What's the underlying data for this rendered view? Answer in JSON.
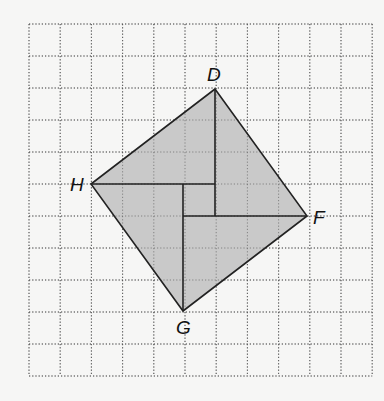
{
  "figure": {
    "type": "geometry-on-grid",
    "colors": {
      "background": "#f6f6f5",
      "grid": "#555555",
      "fill": "#c9c9c9",
      "stroke": "#222222",
      "label": "#111111"
    },
    "grid": {
      "x0": 29,
      "y0": 24,
      "cols": 11,
      "rows": 11,
      "cell_w": 31.2,
      "cell_h": 32
    },
    "vertices": {
      "D": {
        "label": "D",
        "x": 215,
        "y": 89
      },
      "F": {
        "label": "F",
        "x": 307,
        "y": 216
      },
      "G": {
        "label": "G",
        "x": 183,
        "y": 311
      },
      "H": {
        "label": "H",
        "x": 91,
        "y": 184
      }
    },
    "interior_segments": [
      {
        "from": [
          215,
          89
        ],
        "to": [
          215,
          216
        ]
      },
      {
        "from": [
          91,
          184
        ],
        "to": [
          215,
          184
        ]
      },
      {
        "from": [
          307,
          216
        ],
        "to": [
          183,
          216
        ]
      },
      {
        "from": [
          183,
          311
        ],
        "to": [
          183,
          184
        ]
      }
    ],
    "labels": {
      "D": "D",
      "F": "F",
      "G": "G",
      "H": "H"
    }
  }
}
